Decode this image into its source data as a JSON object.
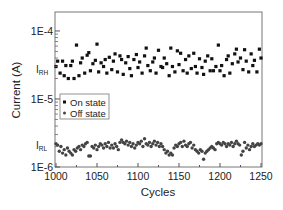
{
  "chart_data": {
    "type": "scatter",
    "title": "",
    "xlabel": "Cycles",
    "ylabel": "Current (A)",
    "yscale": "log",
    "xlim": [
      1000,
      1250
    ],
    "ylim": [
      1e-06,
      0.00019
    ],
    "x_ticks": [
      1000,
      1050,
      1100,
      1150,
      1200,
      1250
    ],
    "y_ticks": [
      {
        "value": 0.0001,
        "label": "1E-4"
      },
      {
        "value": 1e-05,
        "label": "1E-5"
      },
      {
        "value": 1e-06,
        "label": "1E-6"
      }
    ],
    "y_annotations": [
      {
        "value": 2.8e-05,
        "label": "I",
        "sub": "RH"
      },
      {
        "value": 2.1e-06,
        "label": "I",
        "sub": "RL"
      }
    ],
    "grid": false,
    "legend": {
      "position": "center-left",
      "entries": [
        "On state",
        "Off state"
      ]
    },
    "series": [
      {
        "name": "On state",
        "marker": "square",
        "color": "#111111",
        "x": [
          1000,
          1002,
          1005,
          1008,
          1010,
          1012,
          1015,
          1018,
          1020,
          1022,
          1025,
          1028,
          1030,
          1032,
          1035,
          1038,
          1040,
          1042,
          1045,
          1048,
          1050,
          1052,
          1055,
          1058,
          1060,
          1062,
          1065,
          1068,
          1070,
          1072,
          1075,
          1078,
          1080,
          1082,
          1085,
          1088,
          1090,
          1092,
          1095,
          1098,
          1100,
          1102,
          1105,
          1108,
          1110,
          1112,
          1115,
          1118,
          1120,
          1122,
          1125,
          1128,
          1130,
          1132,
          1135,
          1138,
          1140,
          1142,
          1145,
          1148,
          1150,
          1152,
          1155,
          1158,
          1160,
          1162,
          1165,
          1168,
          1170,
          1172,
          1175,
          1178,
          1180,
          1182,
          1185,
          1188,
          1190,
          1192,
          1195,
          1198,
          1200,
          1202,
          1205,
          1208,
          1210,
          1212,
          1215,
          1218,
          1220,
          1222,
          1225,
          1228,
          1230,
          1232,
          1235,
          1238,
          1240,
          1242,
          1245,
          1248,
          1250
        ],
        "y": [
          3e-05,
          3.6e-05,
          2.4e-05,
          3.6e-05,
          2.2e-05,
          3.1e-05,
          2e-05,
          3.1e-05,
          3.6e-05,
          2e-05,
          6.2e-05,
          2.2e-05,
          3.4e-05,
          4e-05,
          2.4e-05,
          4.4e-05,
          4.8e-05,
          2.6e-05,
          3.3e-05,
          3.7e-05,
          6.4e-05,
          2.5e-05,
          3.4e-05,
          3e-05,
          3.8e-05,
          2.4e-05,
          4.1e-05,
          2.7e-05,
          3.6e-05,
          4.6e-05,
          2.5e-05,
          4.3e-05,
          3.8e-05,
          2.3e-05,
          3.4e-05,
          4.2e-05,
          2.8e-05,
          2.2e-05,
          3.8e-05,
          4.5e-05,
          2.9e-05,
          3.5e-05,
          2.4e-05,
          4.3e-05,
          5.6e-05,
          3.1e-05,
          2.6e-05,
          3.5e-05,
          4e-05,
          2.4e-05,
          5.2e-05,
          3e-05,
          2.9e-05,
          4e-05,
          3.3e-05,
          2.2e-05,
          5.6e-05,
          3e-05,
          2.5e-05,
          5.1e-05,
          3.2e-05,
          4.7e-05,
          2.6e-05,
          3.8e-05,
          2.4e-05,
          4.3e-05,
          2.8e-05,
          4.7e-05,
          3e-05,
          2.4e-05,
          3.9e-05,
          2.9e-05,
          2.3e-05,
          3.6e-05,
          4.3e-05,
          2.6e-05,
          3.9e-05,
          2.6e-05,
          3e-05,
          6.2e-05,
          2.6e-05,
          3.1e-05,
          2.2e-05,
          3.8e-05,
          4.3e-05,
          2.4e-05,
          3.3e-05,
          4.6e-05,
          5.4e-05,
          3.5e-05,
          4e-05,
          2.7e-05,
          5.3e-05,
          3.6e-05,
          2.5e-05,
          4.6e-05,
          3.1e-05,
          3.7e-05,
          2.5e-05,
          5.4e-05,
          4e-05
        ]
      },
      {
        "name": "Off state",
        "marker": "circle",
        "color": "#444444",
        "x": [
          1000,
          1002,
          1004,
          1006,
          1008,
          1010,
          1012,
          1014,
          1016,
          1018,
          1020,
          1022,
          1024,
          1026,
          1028,
          1030,
          1032,
          1034,
          1036,
          1038,
          1040,
          1042,
          1044,
          1046,
          1048,
          1050,
          1052,
          1054,
          1056,
          1058,
          1060,
          1062,
          1064,
          1066,
          1068,
          1070,
          1072,
          1074,
          1076,
          1078,
          1080,
          1082,
          1084,
          1086,
          1088,
          1090,
          1092,
          1094,
          1096,
          1098,
          1100,
          1102,
          1104,
          1106,
          1108,
          1110,
          1112,
          1114,
          1116,
          1118,
          1120,
          1122,
          1124,
          1126,
          1128,
          1130,
          1132,
          1134,
          1136,
          1138,
          1140,
          1142,
          1144,
          1146,
          1148,
          1150,
          1152,
          1154,
          1156,
          1158,
          1160,
          1162,
          1164,
          1166,
          1168,
          1170,
          1172,
          1174,
          1176,
          1178,
          1180,
          1182,
          1184,
          1186,
          1188,
          1190,
          1192,
          1194,
          1196,
          1198,
          1200,
          1202,
          1204,
          1206,
          1208,
          1210,
          1212,
          1214,
          1216,
          1218,
          1220,
          1222,
          1224,
          1226,
          1228,
          1230,
          1232,
          1234,
          1236,
          1238,
          1240,
          1242,
          1244,
          1246,
          1248,
          1250
        ],
        "y": [
          2.2e-06,
          2.1e-06,
          1.7e-06,
          2e-06,
          1.6e-06,
          1.8e-06,
          1.5e-06,
          1.9e-06,
          1.7e-06,
          1.6e-06,
          1.5e-06,
          1.8e-06,
          1.7e-06,
          1.9e-06,
          2e-06,
          1.8e-06,
          2.1e-06,
          2e-06,
          2.2e-06,
          2.3e-06,
          1.45e-06,
          1.45e-06,
          2e-06,
          1.9e-06,
          2.1e-06,
          1.8e-06,
          2e-06,
          2.2e-06,
          2.1e-06,
          1.9e-06,
          2.2e-06,
          2e-06,
          2.3e-06,
          1.9e-06,
          2.1e-06,
          1.9e-06,
          2.2e-06,
          2e-06,
          1.8e-06,
          2.3e-06,
          2.5e-06,
          2.3e-06,
          2.2e-06,
          2.4e-06,
          2.1e-06,
          2.3e-06,
          2e-06,
          2.2e-06,
          1.9e-06,
          2.1e-06,
          2.3e-06,
          2.2e-06,
          2.4e-06,
          2e-06,
          2.6e-06,
          2.2e-06,
          2.1e-06,
          2.3e-06,
          2e-06,
          2.2e-06,
          2.4e-06,
          2.1e-06,
          2.3e-06,
          2e-06,
          2.2e-06,
          2e-06,
          1.8e-06,
          1.6e-06,
          1.7e-06,
          1.5e-06,
          1.6e-06,
          1.5e-06,
          1.9e-06,
          2.1e-06,
          2e-06,
          2.2e-06,
          2.3e-06,
          2e-06,
          2.4e-06,
          2.1e-06,
          2e-06,
          2.2e-06,
          2.3e-06,
          1.9e-06,
          2.1e-06,
          1.8e-06,
          1.7e-06,
          1.6e-06,
          1.8e-06,
          1.7e-06,
          1.3e-06,
          1.6e-06,
          1.7e-06,
          1.8e-06,
          1.9e-06,
          2e-06,
          1.9e-06,
          1.8e-06,
          2.2e-06,
          2.3e-06,
          2.2e-06,
          2.1e-06,
          2.3e-06,
          2.2e-06,
          2e-06,
          2.2e-06,
          2.1e-06,
          2.3e-06,
          2e-06,
          2.2e-06,
          2.4e-06,
          2.2e-06,
          2.1e-06,
          1.5e-06,
          1.7e-06,
          2.3e-06,
          1.9e-06,
          2.1e-06,
          1.8e-06,
          2e-06,
          2.2e-06,
          2e-06,
          2.1e-06,
          2.2e-06,
          2.1e-06,
          2.2e-06
        ]
      }
    ]
  }
}
